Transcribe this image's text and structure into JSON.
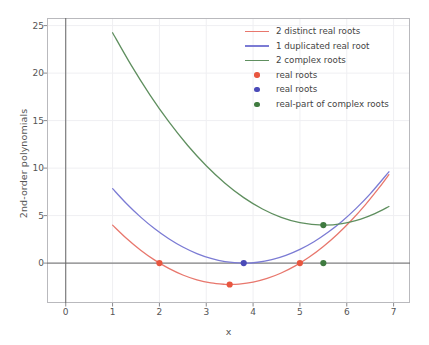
{
  "chart_data": {
    "type": "line",
    "title": "",
    "xlabel": "x",
    "ylabel": "2nd-order polynomials",
    "xlim": [
      -0.4,
      7.35
    ],
    "ylim": [
      -4.2,
      25.8
    ],
    "xticks": [
      "0",
      "1",
      "2",
      "3",
      "4",
      "5",
      "6",
      "7"
    ],
    "xtick_values": [
      0,
      1,
      2,
      3,
      4,
      5,
      6,
      7
    ],
    "yticks": [
      "0",
      "5",
      "10",
      "15",
      "20",
      "25"
    ],
    "ytick_values": [
      0,
      5,
      10,
      15,
      20,
      25
    ],
    "grid": true,
    "legend_position": "upper right",
    "series": [
      {
        "name": "2 distinct real roots",
        "kind": "line",
        "color": "#e8776d",
        "equation": "(x-2)(x-5)",
        "x": [
          1.0,
          1.3,
          1.6,
          1.9,
          2.2,
          2.5,
          2.8,
          3.1,
          3.4,
          3.5,
          3.7,
          4.0,
          4.3,
          4.6,
          4.9,
          5.2,
          5.5,
          5.8,
          6.1,
          6.4,
          6.7,
          6.9
        ],
        "y": [
          4.0,
          2.59,
          1.36,
          0.31,
          -0.56,
          -1.25,
          -1.76,
          -2.09,
          -2.24,
          -2.25,
          -2.21,
          -2.0,
          -1.61,
          -1.04,
          -0.29,
          0.64,
          1.75,
          3.04,
          4.51,
          6.16,
          7.99,
          9.31
        ]
      },
      {
        "name": "1 duplicated real root",
        "kind": "line",
        "color": "#7b7bd4",
        "equation": "(x-3.8)^2",
        "x": [
          1.0,
          1.3,
          1.6,
          1.9,
          2.2,
          2.5,
          2.8,
          3.1,
          3.4,
          3.8,
          4.1,
          4.4,
          4.7,
          5.0,
          5.3,
          5.6,
          5.9,
          6.2,
          6.5,
          6.9
        ],
        "y": [
          7.84,
          6.25,
          4.84,
          3.61,
          2.56,
          1.69,
          1.0,
          0.49,
          0.16,
          0.0,
          0.09,
          0.36,
          0.81,
          1.44,
          2.25,
          3.24,
          4.41,
          5.76,
          7.29,
          9.61
        ]
      },
      {
        "name": "2 complex roots",
        "kind": "line",
        "color": "#5f8f5f",
        "equation": "(x-5.5)^2 + 4",
        "x": [
          1.0,
          1.4,
          1.8,
          2.2,
          2.6,
          3.0,
          3.4,
          3.8,
          4.2,
          4.6,
          5.0,
          5.5,
          5.9,
          6.3,
          6.6,
          6.9
        ],
        "y": [
          24.25,
          20.81,
          17.69,
          14.89,
          12.41,
          10.25,
          8.41,
          6.89,
          5.69,
          4.81,
          4.25,
          4.0,
          4.16,
          4.64,
          5.21,
          5.96
        ]
      }
    ],
    "markers": [
      {
        "name": "real roots",
        "color": "#e8563f",
        "points": [
          [
            2,
            0
          ],
          [
            5,
            0
          ],
          [
            3.5,
            -2.25
          ]
        ]
      },
      {
        "name": "real roots",
        "color": "#4a4ab8",
        "points": [
          [
            3.8,
            0
          ]
        ]
      },
      {
        "name": "real-part of complex roots",
        "color": "#3f7a3f",
        "points": [
          [
            5.5,
            0
          ],
          [
            5.5,
            4.0
          ]
        ]
      }
    ],
    "annotations": []
  },
  "legend": {
    "entries": [
      {
        "label": "2 distinct real roots",
        "kind": "line",
        "color": "#e8776d"
      },
      {
        "label": "1 duplicated real root",
        "kind": "line",
        "color": "#7b7bd4"
      },
      {
        "label": "2 complex roots",
        "kind": "line",
        "color": "#5f8f5f"
      },
      {
        "label": "real roots",
        "kind": "dot",
        "color": "#e8563f"
      },
      {
        "label": "real roots",
        "kind": "dot",
        "color": "#4a4ab8"
      },
      {
        "label": "real-part of complex roots",
        "kind": "dot",
        "color": "#3f7a3f"
      }
    ]
  },
  "colors": {
    "red_curve": "#e8776d",
    "blue_curve": "#7b7bd4",
    "green_curve": "#5f8f5f",
    "red_marker": "#e8563f",
    "blue_marker": "#4a4ab8",
    "green_marker": "#3f7a3f",
    "axis": "#666666",
    "grid": "#efeff2",
    "text": "#555555"
  }
}
